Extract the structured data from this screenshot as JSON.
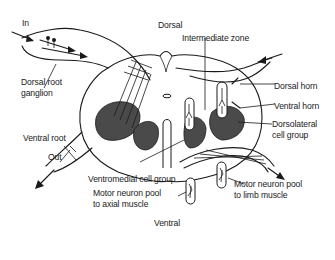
{
  "diagram": {
    "orientation": {
      "top": "Dorsal",
      "bottom": "Ventral"
    },
    "flow": {
      "input": "In",
      "output": "Out"
    },
    "labels": {
      "dorsal_root_ganglion_line1": "Dorsal root",
      "dorsal_root_ganglion_line2": "ganglion",
      "intermediate_zone": "Intermediate zone",
      "dorsal_horn": "Dorsal horn",
      "ventral_horn": "Ventral horn",
      "dorsolateral_line1": "Dorsolateral",
      "dorsolateral_line2": "cell group",
      "ventral_root": "Ventral root",
      "ventromedial": "Ventromedial cell group",
      "axial_pool_line1": "Motor neuron pool",
      "axial_pool_line2": "to axial muscle",
      "limb_pool_line1": "Motor neuron pool",
      "limb_pool_line2": "to limb muscle"
    },
    "colors": {
      "line": "#1a1a1a",
      "grey_matter": "#4a4a4a",
      "background": "#ffffff"
    }
  }
}
